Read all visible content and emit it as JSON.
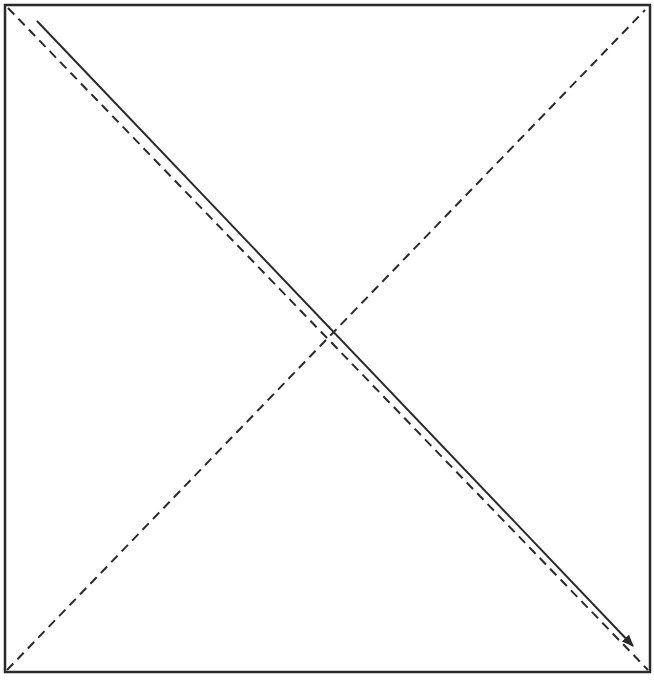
{
  "diagram": {
    "type": "square-with-diagonals",
    "background": "#ffffff",
    "stroke_color": "#2a2a2a",
    "frame": {
      "x": 5,
      "y": 5,
      "width": 645,
      "height": 667,
      "stroke_width": 2.5
    },
    "dashed_diagonals": [
      {
        "name": "dashed-diagonal-top-left-to-bottom-right",
        "x1": 8,
        "y1": 8,
        "x2": 648,
        "y2": 670,
        "dash": "9,6",
        "stroke_width": 2
      },
      {
        "name": "dashed-diagonal-bottom-left-to-top-right",
        "x1": 7,
        "y1": 670,
        "x2": 645,
        "y2": 10,
        "dash": "9,6",
        "stroke_width": 2
      }
    ],
    "solid_arrow": {
      "name": "solid-arrow-diagonal",
      "x1": 37,
      "y1": 21,
      "x2": 633,
      "y2": 646,
      "stroke_width": 2,
      "direction": "down-right"
    }
  }
}
